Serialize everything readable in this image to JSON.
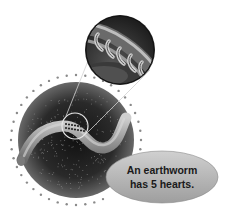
{
  "figure": {
    "subject": "earthworm",
    "callout": {
      "line1": "An earthworm",
      "line2": "has 5 hearts."
    },
    "inset": {
      "label": "magnified-hearts",
      "heart_count": 5
    },
    "colors": {
      "background": "#ffffff",
      "soil_dark": "#1c1c1c",
      "soil_mid": "#555555",
      "worm": "#9a9a9a",
      "worm_highlight": "#c8c8c8",
      "callout_fill": "#b5b5b5",
      "dots": "#8a8a8a"
    }
  }
}
